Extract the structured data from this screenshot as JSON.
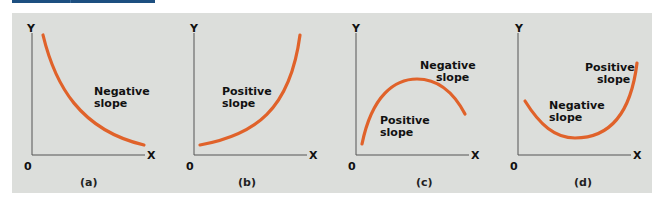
{
  "figure": {
    "curve_color": "#e0622a",
    "axis_color": "#555555",
    "panel_bg": "#dcdedb",
    "header_bar_color": "#1d4f80"
  },
  "panels": [
    {
      "caption": "(a)",
      "y_label": "Y",
      "x_label": "X",
      "origin": "0",
      "labels": [
        {
          "line1": "Negative",
          "line2": "slope"
        }
      ]
    },
    {
      "caption": "(b)",
      "y_label": "Y",
      "x_label": "X",
      "origin": "0",
      "labels": [
        {
          "line1": "Positive",
          "line2": "slope"
        }
      ]
    },
    {
      "caption": "(c)",
      "y_label": "Y",
      "x_label": "X",
      "origin": "0",
      "labels": [
        {
          "line1": "Negative",
          "line2": "slope"
        },
        {
          "line1": "Positive",
          "line2": "slope"
        }
      ]
    },
    {
      "caption": "(d)",
      "y_label": "Y",
      "x_label": "X",
      "origin": "0",
      "labels": [
        {
          "line1": "Positive",
          "line2": "slope"
        },
        {
          "line1": "Negative",
          "line2": "slope"
        }
      ]
    }
  ]
}
